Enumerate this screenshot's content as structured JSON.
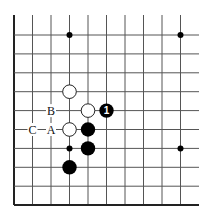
{
  "diagram": {
    "type": "go-board-fragment",
    "colors": {
      "background": "#ffffff",
      "line": "#555555",
      "edge": "#222222",
      "black_stone": "#000000",
      "white_stone_fill": "#ffffff",
      "white_stone_stroke": "#222222",
      "move_number": "#ffffff"
    },
    "grid": {
      "columns": 10,
      "rows": 10,
      "left_edge": true,
      "bottom_edge": true,
      "top_open": true,
      "right_open": true
    },
    "star_points": [
      {
        "col": 3,
        "row": 0
      },
      {
        "col": 9,
        "row": 0
      },
      {
        "col": 3,
        "row": 6
      },
      {
        "col": 9,
        "row": 6
      }
    ],
    "stones": [
      {
        "color": "white",
        "col": 3,
        "row": 3
      },
      {
        "color": "white",
        "col": 4,
        "row": 4
      },
      {
        "color": "white",
        "col": 3,
        "row": 5
      },
      {
        "color": "black",
        "col": 5,
        "row": 4,
        "label": "1"
      },
      {
        "color": "black",
        "col": 4,
        "row": 5
      },
      {
        "color": "black",
        "col": 4,
        "row": 6
      },
      {
        "color": "black",
        "col": 3,
        "row": 7
      }
    ],
    "labels": [
      {
        "text": "B",
        "col": 2,
        "row": 4
      },
      {
        "text": "A",
        "col": 2,
        "row": 5
      },
      {
        "text": "C",
        "col": 1,
        "row": 5
      }
    ]
  }
}
